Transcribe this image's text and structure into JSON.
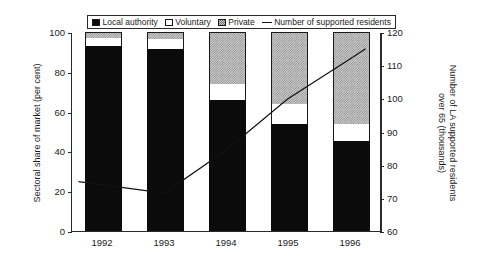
{
  "legend": {
    "items": [
      {
        "label": "Local authority",
        "marker": "solid-black-square-icon"
      },
      {
        "label": "Voluntary",
        "marker": "white-square-icon"
      },
      {
        "label": "Private",
        "marker": "hatched-square-icon"
      },
      {
        "label": "Number of supported residents",
        "marker": "line-segment-icon"
      }
    ]
  },
  "axes": {
    "left": {
      "title": "Sectoral share of market (per cent)",
      "ticks": [
        "0",
        "20",
        "40",
        "60",
        "80",
        "100"
      ]
    },
    "right": {
      "title": "Number of LA supported residents over 65 (thousands)",
      "ticks": [
        "60",
        "70",
        "80",
        "90",
        "100",
        "110",
        "120"
      ]
    },
    "x": {
      "ticks": [
        "1992",
        "1993",
        "1994",
        "1995",
        "1996"
      ]
    }
  },
  "chart_data": {
    "type": "bar",
    "title": "",
    "subtitle": "",
    "xlabel": "",
    "ylabel": "Sectoral share of market (per cent)",
    "y2label": "Number of LA supported residents over 65 (thousands)",
    "categories": [
      "1992",
      "1993",
      "1994",
      "1995",
      "1996"
    ],
    "stacked": true,
    "grid": false,
    "legend_position": "top",
    "ylim": [
      0,
      100
    ],
    "y2lim": [
      60,
      120
    ],
    "yticks": [
      0,
      20,
      40,
      60,
      80,
      100
    ],
    "y2ticks": [
      60,
      70,
      80,
      90,
      100,
      110,
      120
    ],
    "series": [
      {
        "name": "Local authority",
        "axis": "left",
        "type": "bar",
        "color": "#0b0b0b",
        "values": [
          93,
          91.5,
          66,
          54,
          45
        ]
      },
      {
        "name": "Voluntary",
        "axis": "left",
        "type": "bar",
        "color": "#ffffff",
        "values": [
          4,
          5,
          8,
          10,
          9
        ]
      },
      {
        "name": "Private",
        "axis": "left",
        "type": "bar",
        "color": "#cfcfcf",
        "values": [
          3,
          3.5,
          26,
          36,
          46
        ]
      },
      {
        "name": "Number of supported residents",
        "axis": "right",
        "type": "line",
        "color": "#111111",
        "values": [
          74,
          71.5,
          84.5,
          100,
          112
        ]
      }
    ]
  }
}
